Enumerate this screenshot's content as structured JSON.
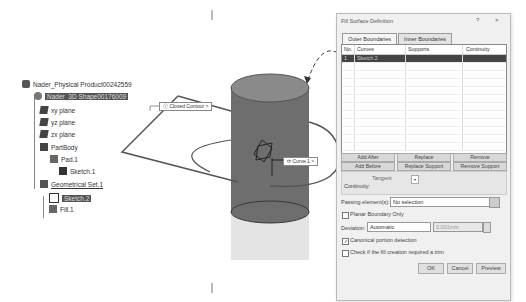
{
  "tree": {
    "root": "Nader_Physical Product00242559",
    "shape": "Nader_3D Shape00176009",
    "items": [
      {
        "label": "xy plane",
        "icon": "plane-icon"
      },
      {
        "label": "yz plane",
        "icon": "plane-icon"
      },
      {
        "label": "zx plane",
        "icon": "plane-icon"
      },
      {
        "label": "PartBody",
        "icon": "body-icon"
      },
      {
        "label": "Pad.1",
        "icon": "pad-icon"
      },
      {
        "label": "Sketch.1",
        "icon": "sketch-icon"
      },
      {
        "label": "Geometrical Set.1",
        "icon": "geoset-icon"
      },
      {
        "label": "Sketch.2",
        "icon": "sketch-icon"
      },
      {
        "label": "Fill.1",
        "icon": "fill-icon"
      }
    ]
  },
  "viewport": {
    "labels": {
      "closed_contour": "Closed Contour",
      "curve": "Curve.1"
    },
    "colors": {
      "cylinder": "#6e6e6e",
      "cylinder_top": "#888888",
      "outline": "#555555"
    }
  },
  "dialog": {
    "title": "Fill Surface Definition",
    "help": "?",
    "close": "×",
    "tabs": [
      "Outer Boundaries",
      "Inner Boundaries"
    ],
    "table": {
      "headers": [
        "No.",
        "Curves",
        "Supports",
        "Continuity"
      ],
      "rows": [
        [
          "1",
          "Sketch.2",
          "",
          ""
        ]
      ]
    },
    "buttons_row1": [
      "Add After",
      "Replace",
      "Remove"
    ],
    "buttons_row2": [
      "Add Before",
      "Replace Support",
      "Remove Support"
    ],
    "continuity_label": "Continuity:",
    "continuity_value": "Tangent",
    "passing_label": "Passing element(s):",
    "passing_value": "No selection",
    "planar_label": "Planar Boundary Only",
    "deviation_label": "Deviation:",
    "deviation_value": "Automatic",
    "deviation_amount": "0.001mm",
    "canonical_label": "Canonical portion detection",
    "canonical_checked": true,
    "check_label": "Check if the fill creation required a trim",
    "footer": {
      "ok": "OK",
      "cancel": "Cancel",
      "preview": "Preview"
    }
  }
}
